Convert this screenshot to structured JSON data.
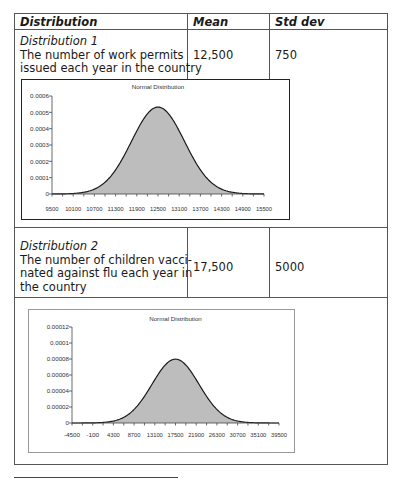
{
  "table": {
    "headers": [
      "Distribution",
      "Mean",
      "Std dev"
    ],
    "rows": [
      {
        "name": "Distribution 1",
        "description_lines": [
          "The number of work permits",
          "issued each year in the country"
        ],
        "mean": "12,500",
        "std_dev": "750"
      },
      {
        "name": "Distribution 2",
        "description_lines": [
          "The number of children vacci-",
          "nated against flu each year in",
          "the country"
        ],
        "mean": "17,500",
        "std_dev": "5000"
      }
    ]
  },
  "chart_data": [
    {
      "type": "area",
      "title": "Normal Distribution",
      "mean": 12500,
      "std_dev": 750,
      "xlabel": "",
      "ylabel": "",
      "x_tick_labels": [
        "9500",
        "10100",
        "10700",
        "11300",
        "11900",
        "12500",
        "13100",
        "13700",
        "14300",
        "14900",
        "15500"
      ],
      "y_tick_labels": [
        "0",
        "0.0001",
        "0.0002",
        "0.0003",
        "0.0004",
        "0.0005",
        "0.0006"
      ],
      "xlim": [
        9500,
        15500
      ],
      "ylim": [
        0,
        0.0006
      ],
      "peak_value": 0.000532,
      "grid": false,
      "fill_color": "#bdbdbd",
      "line_color": "#1a1a1a"
    },
    {
      "type": "area",
      "title": "Normal Distribution",
      "mean": 17500,
      "std_dev": 5000,
      "xlabel": "",
      "ylabel": "",
      "x_tick_labels": [
        "-4500",
        "-100",
        "4300",
        "8700",
        "13100",
        "17500",
        "21900",
        "26300",
        "30700",
        "35100",
        "39500"
      ],
      "y_tick_labels": [
        "0",
        "0.00002",
        "0.00004",
        "0.00006",
        "0.00008",
        "0.0001",
        "0.00012"
      ],
      "xlim": [
        -4500,
        39500
      ],
      "ylim": [
        0,
        0.00012
      ],
      "peak_value": 7.98e-05,
      "grid": false,
      "fill_color": "#bdbdbd",
      "line_color": "#1a1a1a"
    }
  ]
}
